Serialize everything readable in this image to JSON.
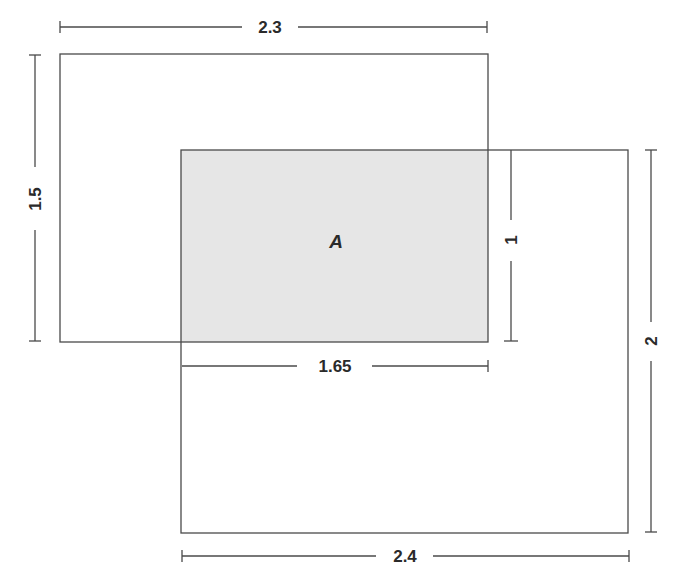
{
  "diagram": {
    "type": "overlapping-rectangles-area",
    "colors": {
      "stroke": "#4a4a4a",
      "overlap_fill": "#e6e6e6",
      "text": "#2a2a2a",
      "background": "#ffffff"
    },
    "rectangle_1": {
      "width_label": "2.3",
      "height_label": "1.5"
    },
    "rectangle_2": {
      "width_label": "2.4",
      "height_label": "2"
    },
    "overlap": {
      "label": "A",
      "width_label": "1.65",
      "height_label": "1"
    }
  }
}
